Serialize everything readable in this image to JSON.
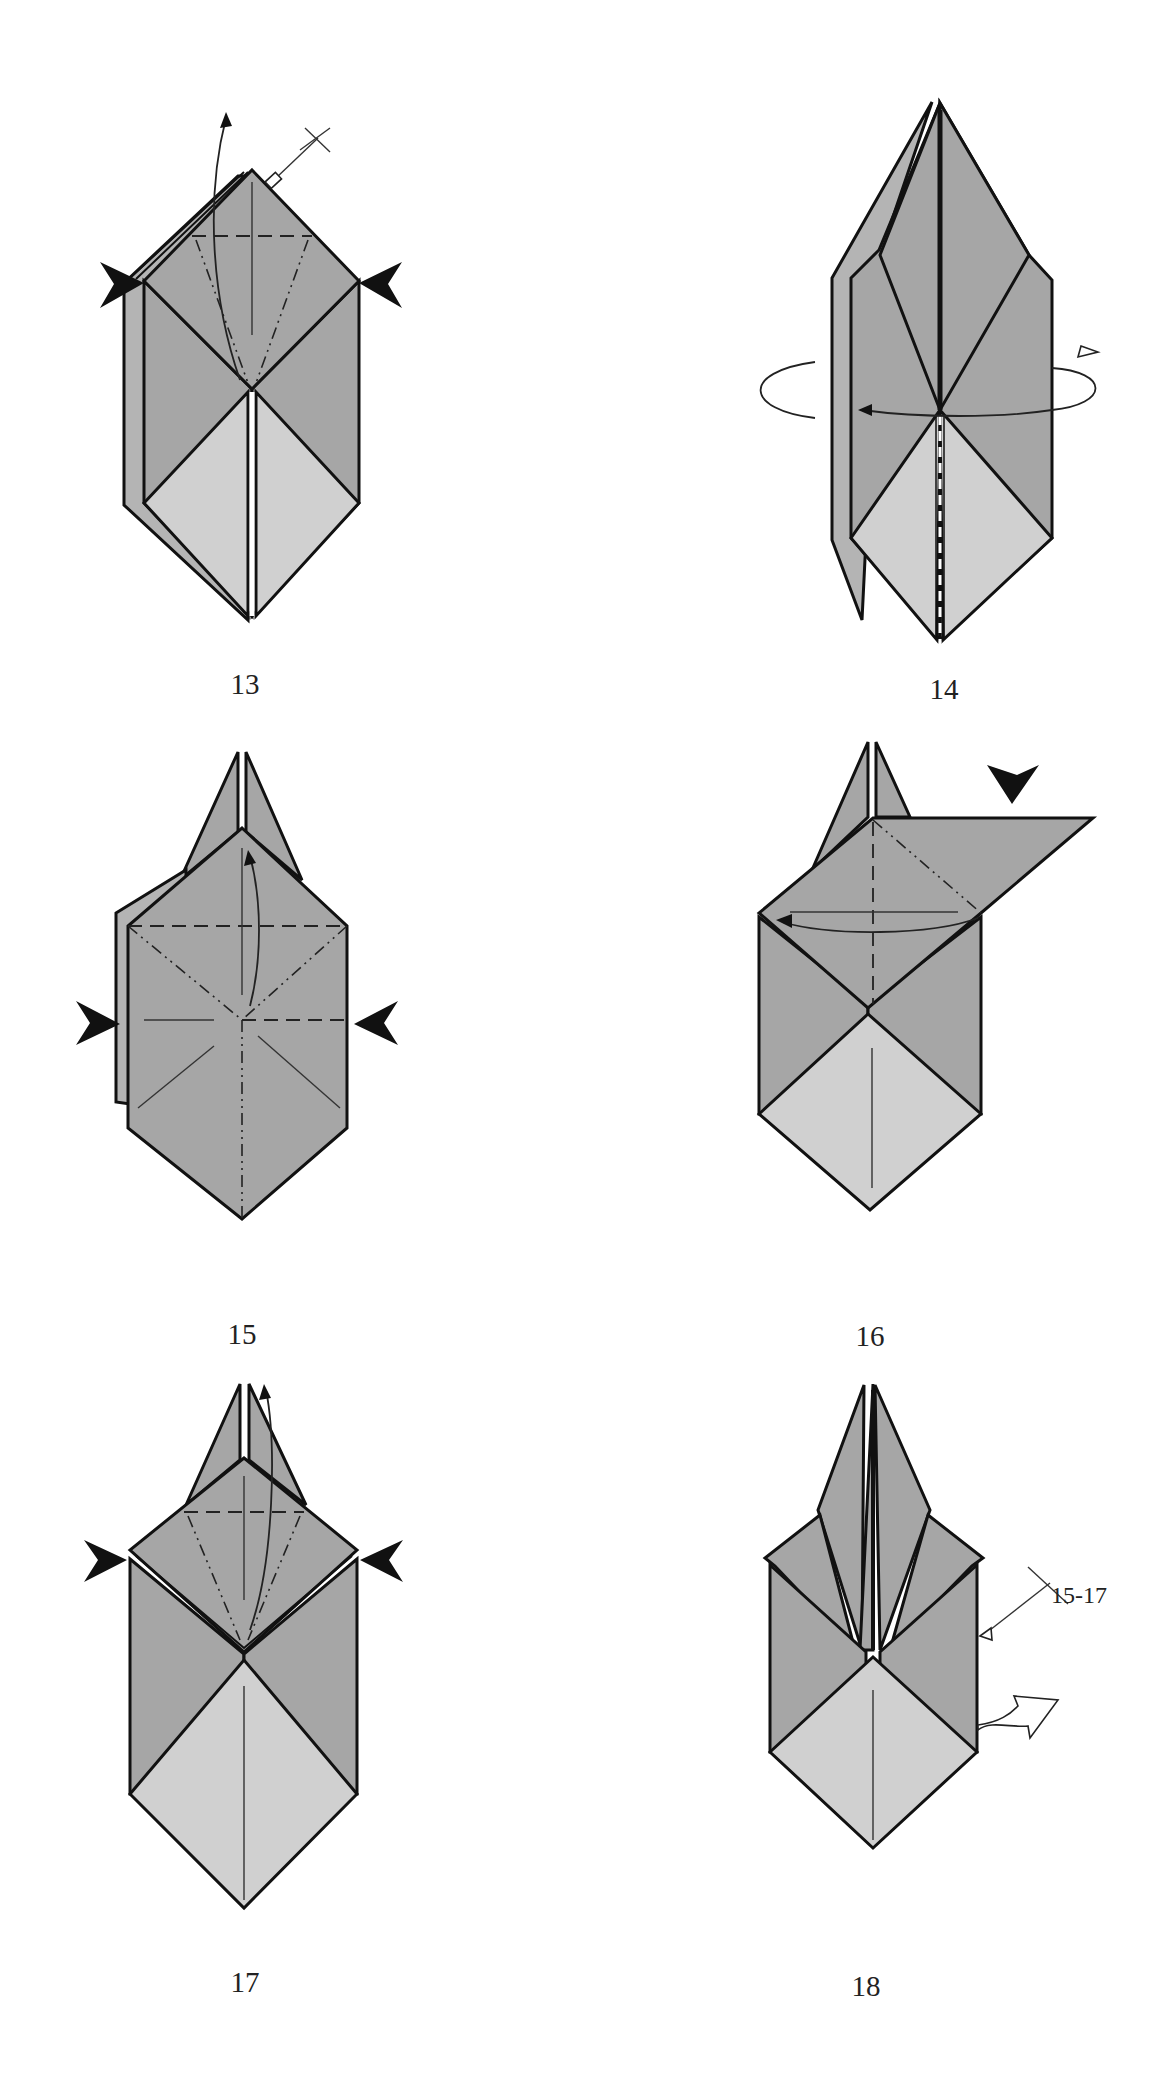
{
  "diagram": {
    "type": "origami folding instructions",
    "colors": {
      "paper_dark": "#a6a6a6",
      "paper_light": "#d0d0d0",
      "line": "#111111",
      "background": "#ffffff"
    },
    "steps": [
      {
        "number": "13",
        "label": "13",
        "symbols": [
          "squash-push-arrows",
          "valley-fold-line",
          "mountain-fold-lines",
          "lift-arrow",
          "repeat-behind-marker"
        ]
      },
      {
        "number": "14",
        "label": "14",
        "symbols": [
          "turn-over-rotation-arrow",
          "center-dashed-line"
        ]
      },
      {
        "number": "15",
        "label": "15",
        "symbols": [
          "squash-push-arrows",
          "valley-fold-lines",
          "mountain-fold-lines",
          "lift-arrow"
        ]
      },
      {
        "number": "16",
        "label": "16",
        "symbols": [
          "push-arrow",
          "valley-fold-line",
          "mountain-fold-line",
          "fold-over-arrow"
        ]
      },
      {
        "number": "17",
        "label": "17",
        "symbols": [
          "squash-push-arrows",
          "valley-fold-line",
          "mountain-fold-lines",
          "lift-arrow"
        ]
      },
      {
        "number": "18",
        "label": "18",
        "symbols": [
          "repeat-steps-marker",
          "turn-over-arrow"
        ],
        "annotation": "15-17"
      }
    ]
  }
}
